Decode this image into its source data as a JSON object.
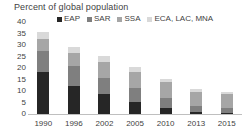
{
  "chart_data": {
    "type": "bar",
    "stacked": true,
    "title": "Percent of global population",
    "xlabel": "",
    "ylabel": "",
    "ylim": [
      0,
      40
    ],
    "ytick_step": 5,
    "yticks": [
      "40",
      "35",
      "30",
      "25",
      "20",
      "15",
      "10",
      "5",
      "0"
    ],
    "grid": false,
    "legend_position": "top",
    "categories": [
      "1990",
      "1996",
      "2002",
      "2005",
      "2010",
      "2013",
      "2015"
    ],
    "series": [
      {
        "name": "EAP",
        "color": "#262626",
        "values": [
          18.3,
          12.3,
          8.5,
          5.3,
          2.7,
          0.7,
          0.6
        ]
      },
      {
        "name": "SAR",
        "color": "#7f7f7f",
        "values": [
          9.3,
          8.6,
          7.1,
          6.0,
          4.4,
          3.0,
          2.2
        ]
      },
      {
        "name": "SSA",
        "color": "#a6a6a6",
        "values": [
          5.0,
          5.7,
          7.1,
          7.1,
          6.7,
          5.9,
          5.7
        ]
      },
      {
        "name": "ECA, LAC, MNA",
        "color": "#d9d9d9",
        "values": [
          2.9,
          2.7,
          2.7,
          2.1,
          1.5,
          1.4,
          1.2
        ]
      }
    ],
    "totals": [
      35.5,
      29.3,
      25.4,
      20.5,
      15.3,
      11.0,
      9.7
    ]
  },
  "axis": {
    "baseline_color": "#bfbfbf",
    "text_color": "#3f3f3f"
  }
}
